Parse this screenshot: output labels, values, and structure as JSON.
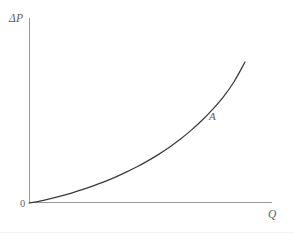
{
  "figure": {
    "background_color": "#ffffff",
    "axis_color": "#9a9a9a",
    "curve_color": "#3a3a3a",
    "label_color": "#5b5b5b"
  },
  "labels": {
    "y_axis": "ΔP",
    "x_axis": "Q",
    "origin": "0",
    "curve": "A"
  },
  "chart_data": {
    "type": "line",
    "title": "",
    "subtitle": "",
    "xlabel": "Q",
    "ylabel": "ΔP",
    "grid": false,
    "legend": false,
    "legend_position": "none",
    "axis_style": "open-corner",
    "tick_labels": {
      "x": [],
      "y": [
        "0"
      ]
    },
    "xlim": [
      0,
      1
    ],
    "ylim": [
      0,
      1
    ],
    "annotations": [
      {
        "text": "A",
        "x": 0.84,
        "y": 0.56,
        "style": "italic",
        "describes": "curve-label"
      },
      {
        "text": "0",
        "x": 0.0,
        "y": 0.0,
        "style": "roman",
        "describes": "origin-label"
      }
    ],
    "series": [
      {
        "name": "A",
        "shape": "convex-increasing",
        "x": [
          0.0,
          0.05,
          0.1,
          0.15,
          0.2,
          0.25,
          0.3,
          0.35,
          0.4,
          0.45,
          0.5,
          0.55,
          0.6,
          0.65,
          0.7,
          0.75,
          0.8,
          0.85,
          0.9,
          0.95,
          1.0
        ],
        "y": [
          0.0,
          0.014,
          0.031,
          0.05,
          0.072,
          0.096,
          0.123,
          0.152,
          0.184,
          0.219,
          0.257,
          0.299,
          0.345,
          0.396,
          0.452,
          0.515,
          0.585,
          0.664,
          0.753,
          0.862,
          1.0
        ]
      }
    ]
  }
}
